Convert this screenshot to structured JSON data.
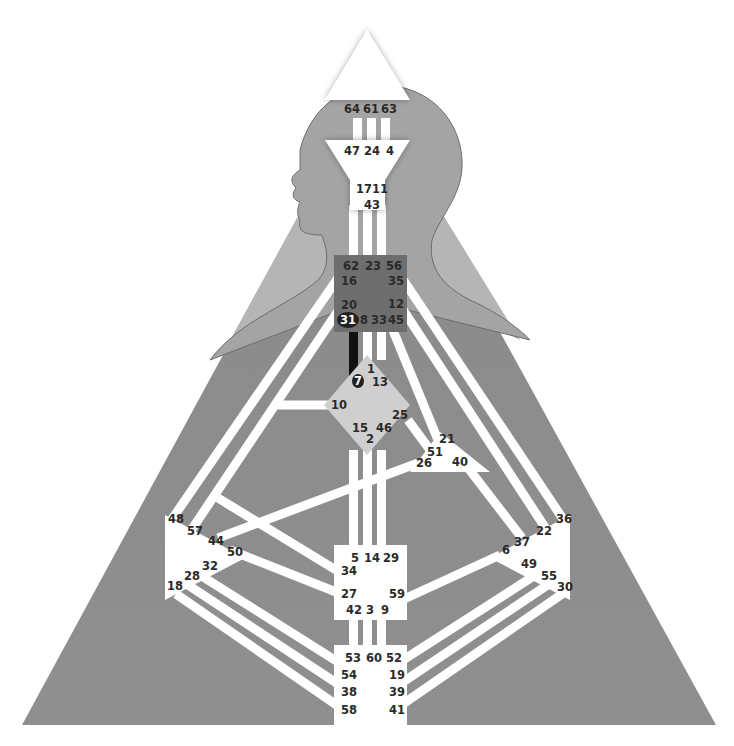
{
  "diagram": {
    "type": "human-design-bodygraph",
    "colors": {
      "background": "#ffffff",
      "outer_triangle": "#8c8c8c",
      "head_silhouette": "#a6a6a6",
      "shoulder_region": "#b4b4b4",
      "channel_open": "#ffffff",
      "channel_defined": "#111111",
      "center_open": "#ffffff",
      "center_throat": "#6e6e6e",
      "center_g": "#cfcfcf",
      "label_text": "#2a2a2a"
    },
    "centers": {
      "head": {
        "gates": [
          "64",
          "61",
          "63"
        ]
      },
      "ajna": {
        "gates": [
          "47",
          "24",
          "4",
          "17",
          "11",
          "43"
        ]
      },
      "throat": {
        "gates": [
          "62",
          "23",
          "56",
          "16",
          "35",
          "20",
          "12",
          "31",
          "8",
          "33",
          "45"
        ]
      },
      "g": {
        "gates": [
          "1",
          "7",
          "13",
          "10",
          "25",
          "15",
          "46",
          "2"
        ]
      },
      "heart": {
        "gates": [
          "21",
          "51",
          "26",
          "40"
        ]
      },
      "spleen": {
        "gates": [
          "48",
          "57",
          "44",
          "50",
          "32",
          "28",
          "18"
        ]
      },
      "solar_plexus": {
        "gates": [
          "36",
          "22",
          "37",
          "6",
          "49",
          "55",
          "30"
        ]
      },
      "sacral": {
        "gates": [
          "5",
          "14",
          "29",
          "34",
          "27",
          "59",
          "42",
          "3",
          "9"
        ]
      },
      "root": {
        "gates": [
          "53",
          "60",
          "52",
          "54",
          "19",
          "38",
          "39",
          "58",
          "41"
        ]
      }
    },
    "labels": {
      "g64": "64",
      "g61": "61",
      "g63": "63",
      "g47": "47",
      "g24": "24",
      "g4": "4",
      "g17": "17",
      "g11": "11",
      "g43": "43",
      "g62": "62",
      "g23": "23",
      "g56": "56",
      "g16": "16",
      "g35": "35",
      "g20": "20",
      "g12": "12",
      "g31": "31",
      "g8": "8",
      "g33": "33",
      "g45": "45",
      "g1": "1",
      "g7": "7",
      "g13": "13",
      "g10": "10",
      "g25": "25",
      "g15": "15",
      "g46": "46",
      "g2": "2",
      "g21": "21",
      "g51": "51",
      "g26": "26",
      "g40": "40",
      "g48": "48",
      "g57": "57",
      "g44": "44",
      "g50": "50",
      "g32": "32",
      "g28": "28",
      "g18": "18",
      "g36": "36",
      "g22": "22",
      "g37": "37",
      "g6": "6",
      "g49": "49",
      "g55": "55",
      "g30": "30",
      "g5": "5",
      "g14": "14",
      "g29": "29",
      "g34": "34",
      "g27": "27",
      "g59": "59",
      "g42": "42",
      "g3": "3",
      "g9": "9",
      "g53": "53",
      "g60": "60",
      "g52": "52",
      "g54": "54",
      "g19": "19",
      "g38": "38",
      "g39": "39",
      "g58": "58",
      "g41": "41"
    },
    "defined_gates": [
      "31",
      "7"
    ],
    "defined_channels": [
      [
        "7",
        "31"
      ]
    ]
  }
}
